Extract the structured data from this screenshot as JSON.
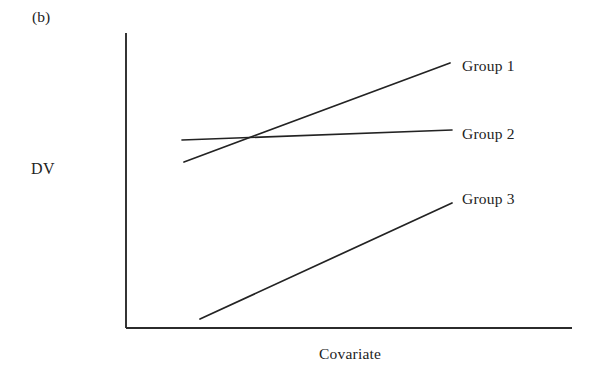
{
  "figure": {
    "panel_tag": "(b)",
    "background_color": "#ffffff",
    "ink_color": "#232323",
    "width": 596,
    "height": 381
  },
  "chart_data": {
    "type": "line",
    "title": "(b)",
    "xlabel": "Covariate",
    "ylabel": "DV",
    "grid": false,
    "legend_position": "right-inline-labels",
    "axis_style": "open-L-axes-no-ticks",
    "xlim": [
      0,
      1
    ],
    "ylim": [
      0,
      1
    ],
    "axis_tick_labels": {
      "x": [],
      "y": []
    },
    "annotations": [
      {
        "text": "(b)",
        "x_px": 32,
        "y_px": 9
      },
      {
        "text": "DV",
        "x_px": 31,
        "y_px": 161
      },
      {
        "text": "Covariate",
        "x_px": 319,
        "y_px": 346
      }
    ],
    "axes_px": {
      "y_axis": {
        "x": 126,
        "y_top": 33,
        "y_bottom": 328
      },
      "x_axis": {
        "y": 328,
        "x_left": 126,
        "x_right": 572
      }
    },
    "series": [
      {
        "name": "Group 1",
        "label": "Group 1",
        "color": "#232323",
        "points_px": [
          [
            184,
            162
          ],
          [
            450,
            63
          ]
        ],
        "x": [
          0.13,
          0.73
        ],
        "values": [
          0.56,
          0.9
        ],
        "slope": "steep positive",
        "label_pos_px": [
          462,
          58
        ]
      },
      {
        "name": "Group 2",
        "label": "Group 2",
        "color": "#232323",
        "points_px": [
          [
            182,
            140
          ],
          [
            452,
            130
          ]
        ],
        "x": [
          0.13,
          0.73
        ],
        "values": [
          0.64,
          0.67
        ],
        "slope": "near flat positive",
        "label_pos_px": [
          462,
          126
        ]
      },
      {
        "name": "Group 3",
        "label": "Group 3",
        "color": "#232323",
        "points_px": [
          [
            200,
            319
          ],
          [
            452,
            203
          ]
        ],
        "x": [
          0.17,
          0.73
        ],
        "values": [
          0.03,
          0.42
        ],
        "slope": "moderate positive",
        "label_pos_px": [
          462,
          191
        ]
      }
    ]
  }
}
